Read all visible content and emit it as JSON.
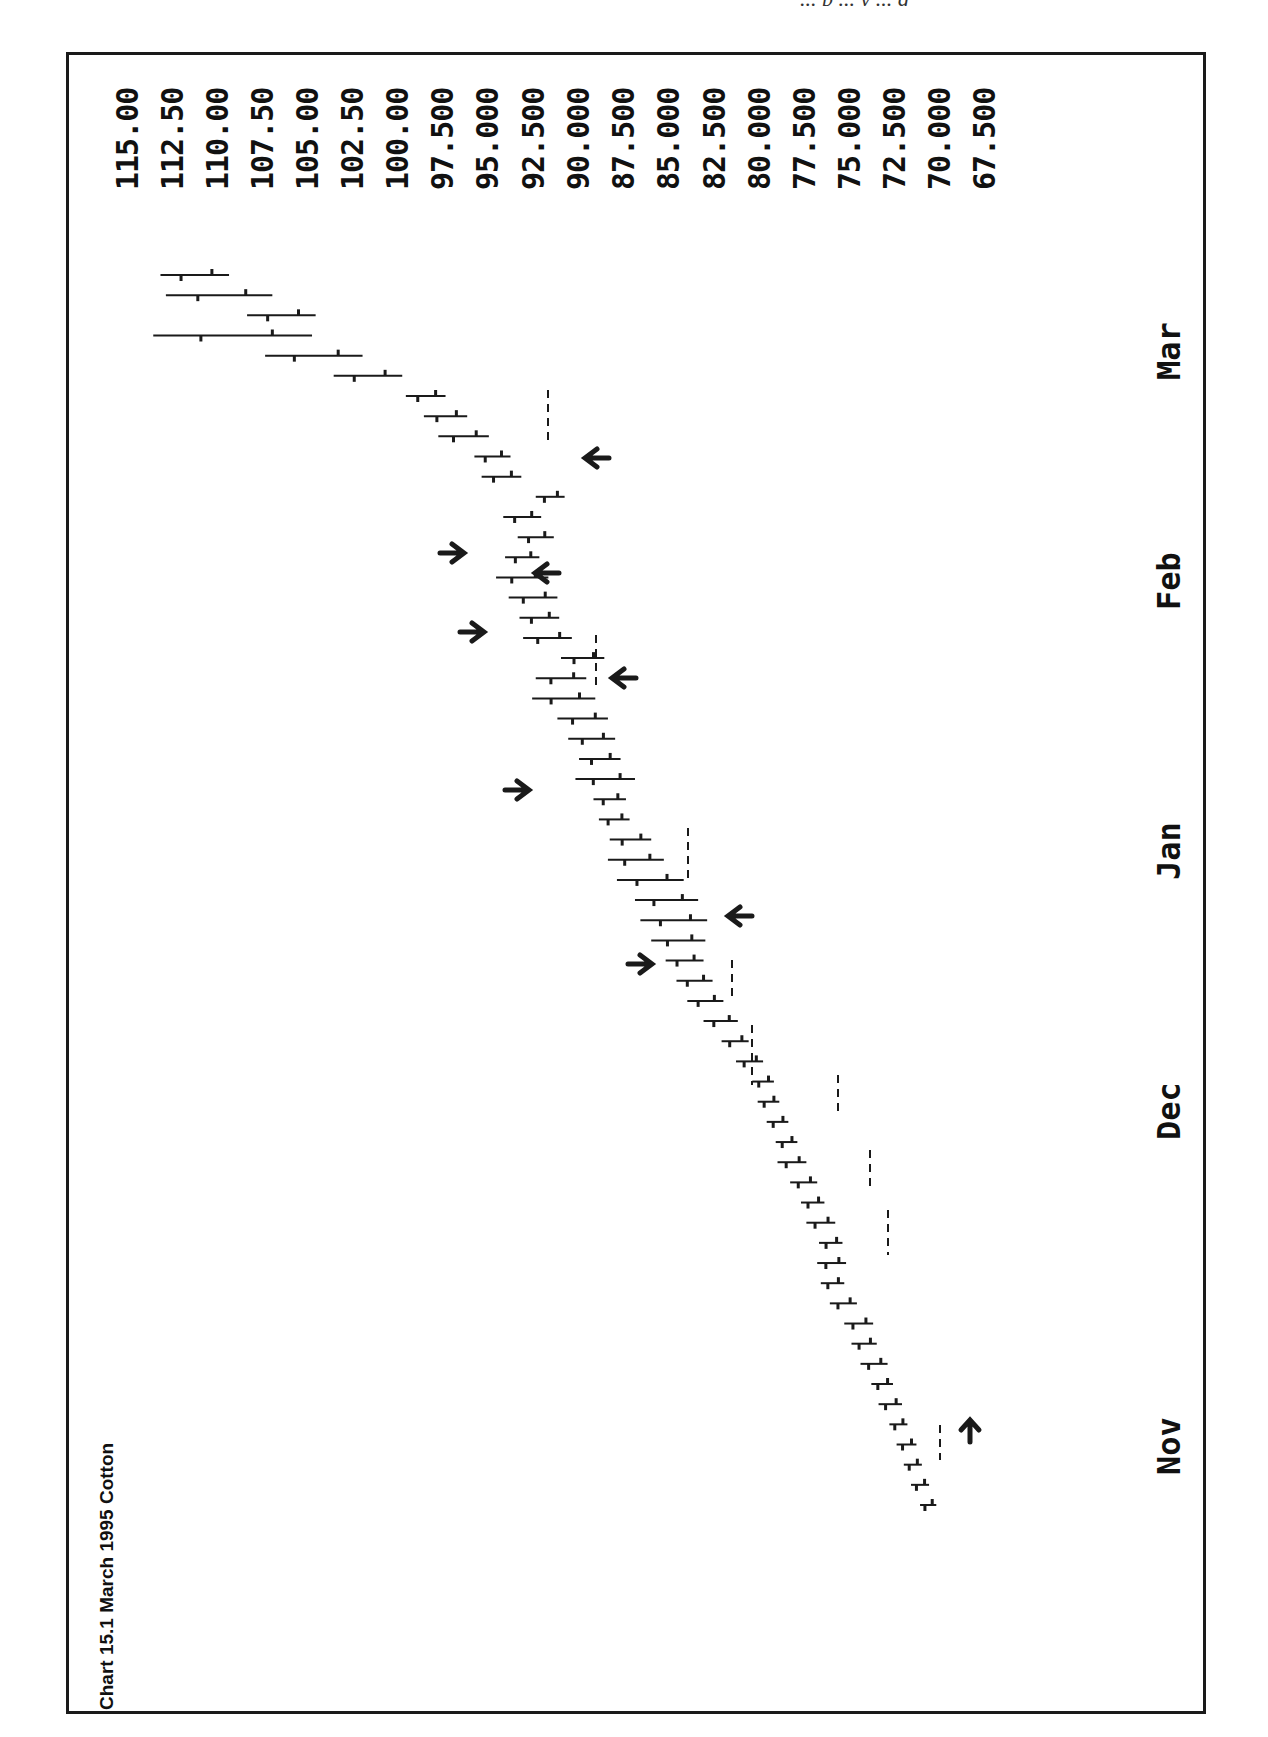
{
  "page": {
    "header_fragment": "... p ... y ... g"
  },
  "chart_data": {
    "type": "bar",
    "subtype": "ohlc-price-bars-rotated",
    "title": "Chart 15.1   March 1995 Cotton",
    "title_parts": {
      "number": "Chart 15.1",
      "name": "March 1995 Cotton"
    },
    "orientation": "rotated 90° counter-clockwise (time runs bottom→top, price axis along top edge)",
    "xlabel": "",
    "ylabel": "",
    "price_ticks": [
      "115.00",
      "112.50",
      "110.00",
      "107.50",
      "105.00",
      "102.50",
      "100.00",
      "97.500",
      "95.000",
      "92.500",
      "90.000",
      "87.500",
      "85.000",
      "82.500",
      "80.000",
      "77.500",
      "75.000",
      "72.500",
      "70.000",
      "67.500"
    ],
    "price_range": [
      67.5,
      115.0
    ],
    "time_labels": [
      "Nov",
      "Dec",
      "Jan",
      "Feb",
      "Mar"
    ],
    "grid": false,
    "legend": null,
    "annotations": {
      "arrows": [
        {
          "near_month": "Nov",
          "direction": "up",
          "note": "signal arrow at start of advance"
        },
        {
          "near_month": "Dec",
          "direction": "right",
          "note": "arrow pointing at bars (early Dec rally)"
        },
        {
          "near_month": "Dec",
          "direction": "left",
          "note": "arrow pointing at pullback low"
        },
        {
          "near_month": "Jan",
          "direction": "right",
          "note": "arrow near start of Jan"
        },
        {
          "near_month": "Jan",
          "direction": "left",
          "note": "arrow at late-Jan low"
        },
        {
          "near_month": "Feb",
          "direction": "right",
          "note": "arrow late Jan / early Feb"
        },
        {
          "near_month": "Feb",
          "direction": "left",
          "note": "arrow at Feb pullback"
        },
        {
          "near_month": "Feb",
          "direction": "right",
          "note": "arrow mid Feb"
        },
        {
          "near_month": "Feb",
          "direction": "left",
          "note": "arrow at late-Feb low before final surge"
        }
      ],
      "dashed_stop_lines": 9
    },
    "series": [
      {
        "name": "March 1995 Cotton daily bars (approx.)",
        "points": [
          {
            "t": "Oct-late",
            "low": 70.2,
            "high": 71.1
          },
          {
            "t": "Oct-late",
            "low": 70.6,
            "high": 71.6
          },
          {
            "t": "Oct-late",
            "low": 71.0,
            "high": 72.0
          },
          {
            "t": "Oct-late",
            "low": 71.3,
            "high": 72.4
          },
          {
            "t": "Oct-late",
            "low": 71.8,
            "high": 72.8
          },
          {
            "t": "Oct-late",
            "low": 72.1,
            "high": 73.4
          },
          {
            "t": "Oct-late",
            "low": 72.6,
            "high": 73.8
          },
          {
            "t": "Nov-early",
            "low": 72.9,
            "high": 74.4
          },
          {
            "t": "Nov-early",
            "low": 73.5,
            "high": 74.9
          },
          {
            "t": "Nov-early",
            "low": 73.7,
            "high": 75.3
          },
          {
            "t": "Nov",
            "low": 74.6,
            "high": 76.1
          },
          {
            "t": "Nov",
            "low": 75.3,
            "high": 76.6
          },
          {
            "t": "Nov",
            "low": 75.2,
            "high": 76.8
          },
          {
            "t": "Nov",
            "low": 75.4,
            "high": 76.7
          },
          {
            "t": "Nov",
            "low": 75.8,
            "high": 77.4
          },
          {
            "t": "Nov",
            "low": 76.4,
            "high": 77.7
          },
          {
            "t": "Nov-mid",
            "low": 76.8,
            "high": 78.3
          },
          {
            "t": "Nov-mid",
            "low": 77.4,
            "high": 79.0
          },
          {
            "t": "Nov-mid",
            "low": 77.9,
            "high": 79.1
          },
          {
            "t": "Nov-late",
            "low": 78.4,
            "high": 79.6
          },
          {
            "t": "Nov-late",
            "low": 78.9,
            "high": 80.1
          },
          {
            "t": "Nov-late",
            "low": 79.2,
            "high": 80.4
          },
          {
            "t": "Dec-early",
            "low": 79.8,
            "high": 81.3
          },
          {
            "t": "Dec-early",
            "low": 80.6,
            "high": 82.1
          },
          {
            "t": "Dec-early",
            "low": 81.2,
            "high": 83.1
          },
          {
            "t": "Dec",
            "low": 82.0,
            "high": 84.0
          },
          {
            "t": "Dec",
            "low": 82.6,
            "high": 84.6
          },
          {
            "t": "Dec",
            "low": 83.1,
            "high": 85.2
          },
          {
            "t": "Dec-mid",
            "low": 83.0,
            "high": 86.0
          },
          {
            "t": "Dec-mid",
            "low": 82.9,
            "high": 86.6
          },
          {
            "t": "Dec-mid",
            "low": 83.4,
            "high": 86.9
          },
          {
            "t": "Dec-late",
            "low": 84.2,
            "high": 87.9
          },
          {
            "t": "Dec-late",
            "low": 85.3,
            "high": 88.4
          },
          {
            "t": "Dec-late",
            "low": 86.0,
            "high": 88.3
          },
          {
            "t": "Jan-early",
            "low": 87.2,
            "high": 88.9
          },
          {
            "t": "Jan-early",
            "low": 87.4,
            "high": 89.2
          },
          {
            "t": "Jan",
            "low": 86.9,
            "high": 90.2
          },
          {
            "t": "Jan",
            "low": 87.7,
            "high": 90.0
          },
          {
            "t": "Jan-mid",
            "low": 88.0,
            "high": 90.6
          },
          {
            "t": "Jan-mid",
            "low": 88.4,
            "high": 91.2
          },
          {
            "t": "Jan-late",
            "low": 89.1,
            "high": 92.6
          },
          {
            "t": "Jan-late",
            "low": 89.6,
            "high": 92.4
          },
          {
            "t": "Jan-late",
            "low": 88.6,
            "high": 91.0
          },
          {
            "t": "Feb-early",
            "low": 90.4,
            "high": 93.1
          },
          {
            "t": "Feb-early",
            "low": 91.1,
            "high": 93.3
          },
          {
            "t": "Feb",
            "low": 91.2,
            "high": 93.9
          },
          {
            "t": "Feb",
            "low": 91.7,
            "high": 94.6
          },
          {
            "t": "Feb",
            "low": 92.2,
            "high": 94.1
          },
          {
            "t": "Feb-mid",
            "low": 91.4,
            "high": 93.4
          },
          {
            "t": "Feb-mid",
            "low": 92.1,
            "high": 94.2
          },
          {
            "t": "Feb-late",
            "low": 90.8,
            "high": 92.4
          },
          {
            "t": "Feb-late",
            "low": 93.2,
            "high": 95.4
          },
          {
            "t": "Feb-late",
            "low": 93.8,
            "high": 95.8
          },
          {
            "t": "Mar-early",
            "low": 95.0,
            "high": 97.8
          },
          {
            "t": "Mar-early",
            "low": 96.2,
            "high": 98.6
          },
          {
            "t": "Mar",
            "low": 97.4,
            "high": 99.6
          },
          {
            "t": "Mar",
            "low": 99.8,
            "high": 103.6
          },
          {
            "t": "Mar",
            "low": 102.0,
            "high": 107.4
          },
          {
            "t": "Mar",
            "low": 104.8,
            "high": 113.6
          },
          {
            "t": "Mar-late",
            "low": 104.6,
            "high": 108.4
          },
          {
            "t": "Mar-late",
            "low": 107.0,
            "high": 112.9
          },
          {
            "t": "Mar-late",
            "low": 109.4,
            "high": 113.2
          }
        ]
      }
    ]
  }
}
